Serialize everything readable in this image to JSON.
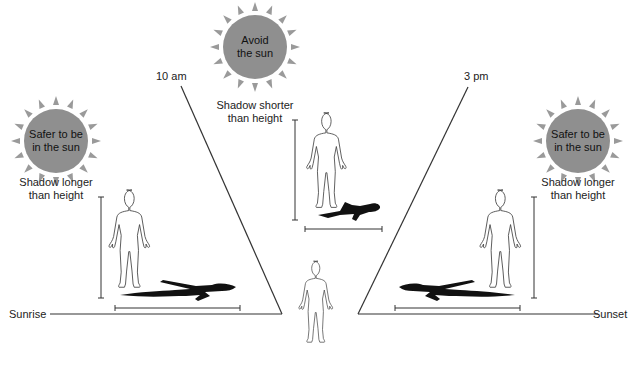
{
  "colors": {
    "sun_fill": "#8f8f8f",
    "sun_rays": "#9a9a9a",
    "line": "#333333",
    "shadow": "#111111"
  },
  "suns": [
    {
      "id": "morning",
      "line1": "Safer to be",
      "line2": "in the sun",
      "caption1": "Shadow longer",
      "caption2": "than height"
    },
    {
      "id": "midday",
      "line1": "Avoid",
      "line2": "the sun",
      "caption1": "Shadow shorter",
      "caption2": "than height"
    },
    {
      "id": "afternoon",
      "line1": "Safer to be",
      "line2": "in the sun",
      "caption1": "Shadow longer",
      "caption2": "than height"
    }
  ],
  "time_labels": {
    "ten_am": "10 am",
    "three_pm": "3 pm",
    "sunrise": "Sunrise",
    "sunset": "Sunset"
  }
}
